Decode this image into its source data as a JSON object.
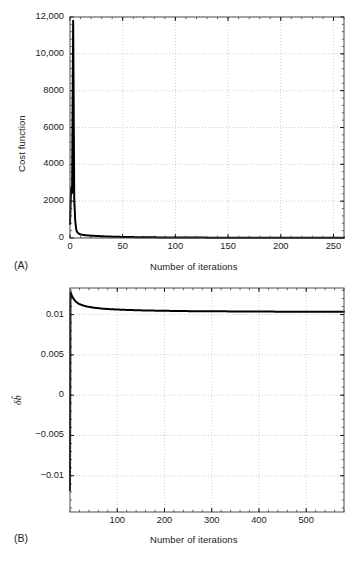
{
  "figure": {
    "panels": [
      {
        "tag": "(A)",
        "xlabel": "Number of iterations",
        "ylabel": "Cost function"
      },
      {
        "tag": "(B)",
        "xlabel": "Number of iterations",
        "ylabel": "δb̂"
      }
    ],
    "caption_fragment": ""
  },
  "chart_data": [
    {
      "type": "line",
      "panel": "A",
      "title": "",
      "xlabel": "Number of iterations",
      "ylabel": "Cost function",
      "xlim": [
        0,
        260
      ],
      "ylim": [
        0,
        12000
      ],
      "xticks": [
        0,
        50,
        100,
        150,
        200,
        250
      ],
      "xticklabels": [
        "0",
        "50",
        "100",
        "150",
        "200",
        "250"
      ],
      "yticks": [
        0,
        2000,
        4000,
        6000,
        8000,
        10000,
        12000
      ],
      "yticklabels": [
        "0",
        "2000",
        "4000",
        "6000",
        "8000",
        "10,000",
        "12,000"
      ],
      "grid": true,
      "grid_style": "dotted",
      "legend": null,
      "line_color": "#000000",
      "series": [
        {
          "name": "cost",
          "x": [
            0,
            1,
            2,
            3,
            4,
            5,
            6,
            7,
            8,
            9,
            10,
            12,
            14,
            16,
            18,
            20,
            25,
            30,
            35,
            40,
            50,
            60,
            80,
            100,
            130,
            160,
            200,
            240,
            260
          ],
          "y": [
            760,
            2700,
            2450,
            11800,
            2150,
            900,
            430,
            310,
            250,
            215,
            195,
            170,
            155,
            145,
            135,
            125,
            110,
            95,
            82,
            72,
            58,
            48,
            35,
            27,
            20,
            16,
            12,
            10,
            9
          ]
        }
      ]
    },
    {
      "type": "line",
      "panel": "B",
      "title": "",
      "xlabel": "Number of iterations",
      "ylabel": "δb̂",
      "xlim": [
        0,
        580
      ],
      "ylim": [
        -0.0145,
        0.0133
      ],
      "xticks": [
        100,
        200,
        300,
        400,
        500
      ],
      "xticklabels": [
        "100",
        "200",
        "300",
        "400",
        "500"
      ],
      "yticks": [
        -0.01,
        -0.005,
        0,
        0.005,
        0.01
      ],
      "yticklabels": [
        "−0.01",
        "−0.005",
        "0",
        "0.005",
        "0.01"
      ],
      "grid": true,
      "grid_style": "dotted",
      "legend": null,
      "line_color": "#000000",
      "series": [
        {
          "name": "delta-b-hat",
          "x": [
            0,
            1,
            2,
            3,
            5,
            8,
            12,
            18,
            25,
            35,
            50,
            70,
            95,
            125,
            160,
            200,
            250,
            300,
            360,
            420,
            480,
            540,
            580
          ],
          "y": [
            -0.0118,
            0.0128,
            0.01265,
            0.01248,
            0.01222,
            0.01192,
            0.01163,
            0.01136,
            0.01118,
            0.01101,
            0.01086,
            0.01073,
            0.01064,
            0.01057,
            0.01051,
            0.01047,
            0.01043,
            0.01041,
            0.01039,
            0.01037,
            0.01036,
            0.01035,
            0.01035
          ]
        }
      ]
    }
  ]
}
